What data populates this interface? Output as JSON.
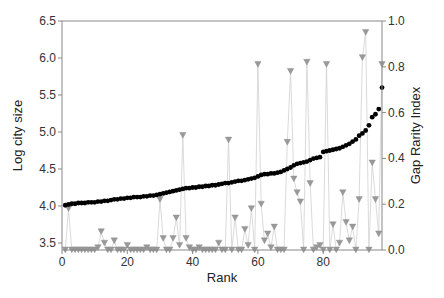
{
  "chart_data": {
    "type": "scatter",
    "title": "",
    "xlabel": "Rank",
    "ylabel": "Log city size",
    "y2label": "Gap Rarity Index",
    "xlim": [
      0,
      98
    ],
    "ylim": [
      3.405,
      6.5
    ],
    "y2lim": [
      0.0,
      1.0
    ],
    "xticks": [
      0,
      20,
      40,
      60,
      80
    ],
    "yticks": [
      3.5,
      4.0,
      4.5,
      5.0,
      5.5,
      6.0,
      6.5
    ],
    "y2ticks": [
      0.0,
      0.2,
      0.4,
      0.6,
      0.8,
      1.0
    ],
    "xtick_labels": [
      "0",
      "20",
      "40",
      "60",
      "80"
    ],
    "ytick_labels": [
      "3.5",
      "4.0",
      "4.5",
      "5.0",
      "5.5",
      "6.0",
      "6.5"
    ],
    "y2tick_labels": [
      "0.0",
      "0.2",
      "0.4",
      "0.6",
      "0.8",
      "1.0"
    ],
    "grid": false,
    "legend": "none",
    "series": [
      {
        "name": "Log city size",
        "axis": "left",
        "marker": "circle",
        "color": "#000000",
        "x": [
          1,
          2,
          3,
          4,
          5,
          6,
          7,
          8,
          9,
          10,
          11,
          12,
          13,
          14,
          15,
          16,
          17,
          18,
          19,
          20,
          21,
          22,
          23,
          24,
          25,
          26,
          27,
          28,
          29,
          30,
          31,
          32,
          33,
          34,
          35,
          36,
          37,
          38,
          39,
          40,
          41,
          42,
          43,
          44,
          45,
          46,
          47,
          48,
          49,
          50,
          51,
          52,
          53,
          54,
          55,
          56,
          57,
          58,
          59,
          60,
          61,
          62,
          63,
          64,
          65,
          66,
          67,
          68,
          69,
          70,
          71,
          72,
          73,
          74,
          75,
          76,
          77,
          78,
          79,
          80,
          81,
          82,
          83,
          84,
          85,
          86,
          87,
          88,
          89,
          90,
          91,
          92,
          93,
          94,
          95,
          96,
          97,
          98
        ],
        "values": [
          4.01,
          4.02,
          4.03,
          4.03,
          4.04,
          4.04,
          4.04,
          4.05,
          4.05,
          4.05,
          4.06,
          4.06,
          4.07,
          4.07,
          4.08,
          4.09,
          4.09,
          4.1,
          4.1,
          4.11,
          4.11,
          4.12,
          4.12,
          4.12,
          4.13,
          4.13,
          4.14,
          4.14,
          4.15,
          4.16,
          4.17,
          4.18,
          4.19,
          4.2,
          4.21,
          4.22,
          4.23,
          4.24,
          4.24,
          4.25,
          4.25,
          4.26,
          4.26,
          4.27,
          4.27,
          4.28,
          4.28,
          4.29,
          4.3,
          4.31,
          4.31,
          4.32,
          4.33,
          4.34,
          4.34,
          4.35,
          4.36,
          4.37,
          4.38,
          4.4,
          4.42,
          4.43,
          4.43,
          4.44,
          4.44,
          4.45,
          4.46,
          4.48,
          4.5,
          4.52,
          4.55,
          4.57,
          4.58,
          4.59,
          4.6,
          4.62,
          4.64,
          4.65,
          4.66,
          4.73,
          4.74,
          4.75,
          4.76,
          4.77,
          4.78,
          4.8,
          4.82,
          4.84,
          4.87,
          4.9,
          4.95,
          4.98,
          5.02,
          5.09,
          5.2,
          5.24,
          5.31,
          5.6
        ]
      },
      {
        "name": "Gap Rarity Index",
        "axis": "right",
        "marker": "triangle-down",
        "color": "#999999",
        "x": [
          1,
          2,
          3,
          4,
          5,
          6,
          7,
          8,
          9,
          10,
          11,
          12,
          13,
          14,
          15,
          16,
          17,
          18,
          19,
          20,
          21,
          22,
          23,
          24,
          25,
          26,
          27,
          28,
          29,
          30,
          31,
          32,
          33,
          34,
          35,
          36,
          37,
          38,
          39,
          40,
          41,
          42,
          43,
          44,
          45,
          46,
          47,
          48,
          49,
          50,
          51,
          52,
          53,
          54,
          55,
          56,
          57,
          58,
          59,
          60,
          61,
          62,
          63,
          64,
          65,
          66,
          67,
          68,
          69,
          70,
          71,
          72,
          73,
          74,
          75,
          76,
          77,
          78,
          79,
          80,
          81,
          82,
          83,
          84,
          85,
          86,
          87,
          88,
          89,
          90,
          91,
          92,
          93,
          94,
          95,
          96,
          97,
          98
        ],
        "values": [
          0.0,
          0.18,
          0.0,
          0.0,
          0.0,
          0.0,
          0.0,
          0.0,
          0.0,
          0.0,
          0.01,
          0.08,
          0.03,
          0.0,
          0.0,
          0.04,
          0.0,
          0.0,
          0.0,
          0.02,
          0.0,
          0.0,
          0.0,
          0.0,
          0.0,
          0.01,
          0.0,
          0.0,
          0.0,
          0.22,
          0.05,
          0.0,
          0.0,
          0.05,
          0.14,
          0.02,
          0.5,
          0.05,
          0.01,
          0.0,
          0.0,
          0.01,
          0.0,
          0.0,
          0.0,
          0.0,
          0.0,
          0.03,
          0.0,
          0.0,
          0.48,
          0.0,
          0.14,
          0.0,
          0.0,
          0.09,
          0.02,
          0.18,
          0.0,
          0.81,
          0.2,
          0.04,
          0.07,
          0.01,
          0.1,
          0.0,
          0.0,
          0.0,
          0.47,
          0.78,
          0.31,
          0.25,
          0.21,
          0.0,
          0.82,
          0.29,
          0.0,
          0.01,
          0.02,
          0.0,
          0.81,
          0.0,
          0.11,
          0.0,
          0.03,
          0.25,
          0.12,
          0.04,
          0.1,
          0.0,
          0.22,
          0.84,
          0.95,
          0.0,
          0.38,
          0.22,
          0.07,
          0.81
        ]
      }
    ]
  }
}
